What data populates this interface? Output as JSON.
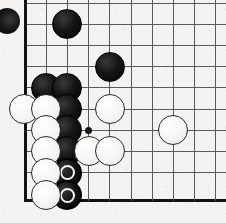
{
  "app": {
    "title": "Go Board Position",
    "type": "go-board-diagram"
  },
  "board": {
    "line_color": "#585a5c",
    "edge_color": "#121212",
    "background_color": "#f4f3f1",
    "black_stone_color": "#131313",
    "white_stone_color": "#f6f5f3",
    "marker_color": "#f3f2f0",
    "grid_spacing": 21.2,
    "stone_diameter": 30,
    "origin_x": 25,
    "origin_y": 3,
    "columns": 10,
    "rows": 10,
    "left_edge_x": 25,
    "bottom_edge_y": 200,
    "description": "Lower-left corner of a Go board showing a capture race; two black stones at the bottom are marked with white circles.",
    "vertical_lines": [
      25,
      46.2,
      67.4,
      88.6,
      109.8,
      131,
      152.2,
      173.4,
      194.6,
      215.8
    ],
    "horizontal_lines": [
      3,
      24.2,
      45.4,
      66.6,
      87.8,
      109,
      130.2,
      151.4,
      172.6,
      200
    ],
    "edges": {
      "left": true,
      "bottom": true,
      "top": false,
      "right": false
    },
    "star_points": [
      {
        "name": "hoshi-lower-left",
        "x": 88.6,
        "y": 130.2
      }
    ]
  },
  "stones": [
    {
      "id": "b1",
      "color": "black",
      "x": 67.4,
      "y": 24.2,
      "marked": false,
      "label": "black-stone-upper"
    },
    {
      "id": "b2",
      "color": "black",
      "x": 109.8,
      "y": 66.6,
      "marked": false,
      "label": "black-stone-center"
    },
    {
      "id": "b3",
      "color": "black",
      "x": 46.2,
      "y": 87.8,
      "marked": false,
      "label": "black-stone-wall-a"
    },
    {
      "id": "b4",
      "color": "black",
      "x": 67.4,
      "y": 87.8,
      "marked": false,
      "label": "black-stone-wall-b"
    },
    {
      "id": "b5",
      "color": "black",
      "x": 67.4,
      "y": 109.0,
      "marked": false,
      "label": "black-stone-wall-c"
    },
    {
      "id": "b6",
      "color": "black",
      "x": 67.4,
      "y": 130.2,
      "marked": false,
      "label": "black-stone-wall-d"
    },
    {
      "id": "b7",
      "color": "black",
      "x": 67.4,
      "y": 151.4,
      "marked": false,
      "label": "black-stone-wall-e"
    },
    {
      "id": "b8",
      "color": "black",
      "x": 67.4,
      "y": 172.6,
      "marked": true,
      "label": "black-stone-marked-upper"
    },
    {
      "id": "b9",
      "color": "black",
      "x": 67.4,
      "y": 195.0,
      "marked": true,
      "label": "black-stone-marked-lower"
    },
    {
      "id": "w1",
      "color": "white",
      "x": 24.0,
      "y": 109.0,
      "marked": false,
      "label": "white-stone-edge"
    },
    {
      "id": "w2",
      "color": "white",
      "x": 46.2,
      "y": 109.0,
      "marked": false,
      "label": "white-stone-left-a"
    },
    {
      "id": "w3",
      "color": "white",
      "x": 46.2,
      "y": 130.2,
      "marked": false,
      "label": "white-stone-left-b"
    },
    {
      "id": "w4",
      "color": "white",
      "x": 46.2,
      "y": 151.4,
      "marked": false,
      "label": "white-stone-left-c"
    },
    {
      "id": "w5",
      "color": "white",
      "x": 46.2,
      "y": 172.6,
      "marked": false,
      "label": "white-stone-left-d"
    },
    {
      "id": "w6",
      "color": "white",
      "x": 46.2,
      "y": 195.0,
      "marked": false,
      "label": "white-stone-left-e"
    },
    {
      "id": "w7",
      "color": "white",
      "x": 109.8,
      "y": 109.0,
      "marked": false,
      "label": "white-stone-center"
    },
    {
      "id": "w8",
      "color": "white",
      "x": 88.6,
      "y": 151.4,
      "marked": false,
      "label": "white-stone-lower-a"
    },
    {
      "id": "w9",
      "color": "white",
      "x": 109.8,
      "y": 151.4,
      "marked": false,
      "label": "white-stone-lower-b"
    },
    {
      "id": "w10",
      "color": "white",
      "x": 173.4,
      "y": 130.2,
      "marked": false,
      "label": "white-stone-right"
    }
  ],
  "corner_decoration": {
    "name": "black-stone-partial-offboard",
    "x": -6,
    "y": 8,
    "size": 26,
    "visible": true
  }
}
